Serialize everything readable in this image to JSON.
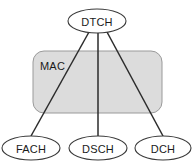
{
  "diagram": {
    "type": "channel-mapping-diagram",
    "background_color": "#ffffff",
    "layer_box": {
      "label": "MAC",
      "fill_color": "#dcdcdc",
      "stroke_color": "#9a9a9a",
      "x": 33,
      "y": 51,
      "width": 129,
      "height": 62,
      "corner_radius": 11,
      "label_x": 40,
      "label_y": 66
    },
    "nodes": [
      {
        "id": "dtch",
        "label": "DTCH",
        "role": "logical-channel",
        "cx": 97,
        "cy": 21,
        "rx": 29,
        "ry": 12
      },
      {
        "id": "fach",
        "label": "FACH",
        "role": "transport-channel",
        "cx": 31,
        "cy": 148,
        "rx": 29,
        "ry": 12
      },
      {
        "id": "dsch",
        "label": "DSCH",
        "role": "transport-channel",
        "cx": 98,
        "cy": 148,
        "rx": 29,
        "ry": 12
      },
      {
        "id": "dch",
        "label": "DCH",
        "role": "transport-channel",
        "cx": 163,
        "cy": 148,
        "rx": 28,
        "ry": 12
      }
    ],
    "links": [
      {
        "id": "dtch-fach",
        "from": "dtch",
        "to": "fach",
        "color": "#2b2b2b",
        "x1": 89,
        "y1": 32,
        "x2": 31,
        "y2": 136
      },
      {
        "id": "dtch-dsch",
        "from": "dtch",
        "to": "dsch",
        "color": "#2b2b2b",
        "x1": 98,
        "y1": 33,
        "x2": 98,
        "y2": 136
      },
      {
        "id": "dtch-dch",
        "from": "dtch",
        "to": "dch",
        "color": "#2b2b2b",
        "x1": 107,
        "y1": 32,
        "x2": 163,
        "y2": 136
      }
    ]
  }
}
